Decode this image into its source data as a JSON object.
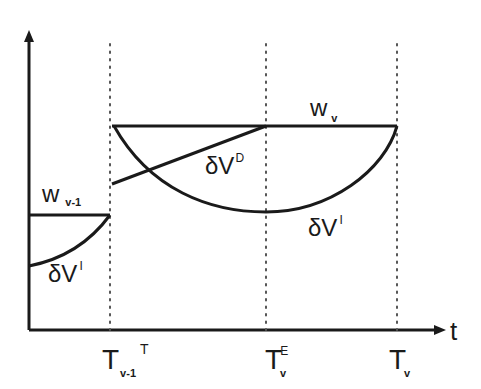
{
  "diagram": {
    "axes": {
      "x_label": "t"
    },
    "time_ticks": [
      {
        "main": "T",
        "sub": "v-1",
        "extra": "T"
      },
      {
        "main": "T",
        "sub": "v",
        "sup": "E"
      },
      {
        "main": "T",
        "sub": "v"
      }
    ],
    "labels": {
      "w_prev": {
        "main": "w",
        "sub": "v-1"
      },
      "w_curr": {
        "main": "w",
        "sub": "v"
      },
      "dV_I_left": {
        "main": "δV",
        "sup": "I"
      },
      "dV_D": {
        "main": "δV",
        "sup": "D"
      },
      "dV_I_right": {
        "main": "δV",
        "sup": "I"
      }
    },
    "colors": {
      "line": "#1a1a1a",
      "dotted": "#555555",
      "background": "#ffffff"
    }
  }
}
